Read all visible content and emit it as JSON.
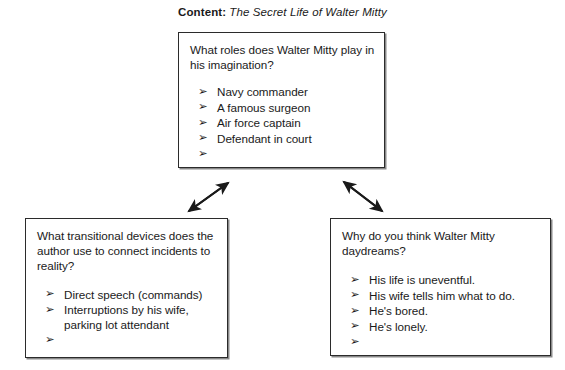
{
  "header": {
    "label": "Content:",
    "title": "The Secret Life of Walter Mitty"
  },
  "colors": {
    "page_background": "#ffffff",
    "box_border": "#2b2b2b",
    "text": "#1a1a1a",
    "arrow": "#1a1a1a"
  },
  "bullet_marker": "➢",
  "boxes": {
    "top": {
      "question": "What roles does Walter Mitty play in his imagination?",
      "items": [
        "Navy commander",
        "A famous surgeon",
        "Air force captain",
        "Defendant in court",
        ""
      ]
    },
    "bottom_left": {
      "question": "What transitional devices does the author use to connect incidents to reality?",
      "items": [
        "Direct speech (commands)",
        "Interruptions by his wife,",
        "",
        ""
      ],
      "item2_continuation": "parking lot attendant"
    },
    "bottom_right": {
      "question": "Why do you think Walter Mitty daydreams?",
      "items": [
        "His life is uneventful.",
        "His wife tells him what to do.",
        "He's bored.",
        "He's lonely.",
        ""
      ]
    }
  },
  "connectors": [
    {
      "name": "top-to-bottom-left",
      "style": "double-headed-diagonal"
    },
    {
      "name": "top-to-bottom-right",
      "style": "double-headed-diagonal"
    }
  ]
}
